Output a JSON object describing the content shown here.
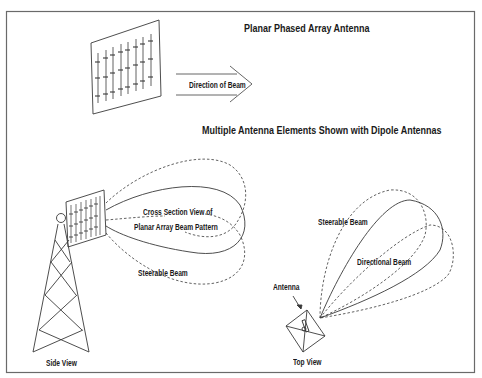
{
  "figure": {
    "title": "Planar Phased Array Antenna",
    "subtitle": "Multiple Antenna Elements Shown with Dipole Antennas",
    "arrow_label": "Direction of Beam",
    "side_view": {
      "caption": "Side View",
      "beam_label_line1": "Cross Section View of",
      "beam_label_line2": "Planar Array Beam Pattern",
      "steerable_label": "Steerable Beam"
    },
    "top_view": {
      "caption": "Top View",
      "antenna_label": "Antenna",
      "steerable_label": "Steerable Beam",
      "directional_label": "Directional Beam"
    }
  },
  "colors": {
    "line": "#3a3a3a",
    "frame": "#6a6a6a",
    "background": "#ffffff"
  }
}
